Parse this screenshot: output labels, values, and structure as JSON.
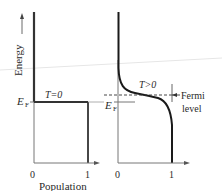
{
  "diagram": {
    "left_panel": {
      "y_axis_label": "Energy",
      "fermi_label": "E",
      "fermi_subscript": "F",
      "temperature_label": "T=0",
      "x_ticks": [
        "0",
        "1"
      ],
      "x_axis_label": "Population"
    },
    "right_panel": {
      "fermi_label": "E",
      "fermi_subscript": "F",
      "temperature_label": "T>0",
      "x_ticks": [
        "0",
        "1"
      ],
      "annotation_line1": "Fermi",
      "annotation_line2": "level"
    },
    "colors": {
      "curve": "#1a1a1a",
      "axis": "#555555",
      "text": "#2a2a2a"
    }
  }
}
